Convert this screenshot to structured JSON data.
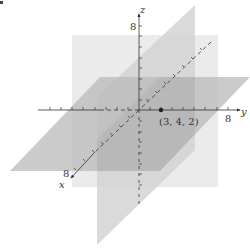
{
  "diagram": {
    "type": "3d-coordinate-system",
    "axes": {
      "x": {
        "label": "x",
        "tick_label": "8"
      },
      "y": {
        "label": "y",
        "tick_label": "8"
      },
      "z": {
        "label": "z",
        "tick_label": "8"
      }
    },
    "point": {
      "label": "(3, 4, 2)",
      "coords": [
        3,
        4,
        2
      ]
    },
    "planes": [
      {
        "name": "plane-x-eq-3",
        "color": "#ebebeb"
      },
      {
        "name": "plane-y-eq-4",
        "color": "#d6d6d6"
      },
      {
        "name": "plane-z-eq-2",
        "color": "#c3c3c3"
      }
    ],
    "colors": {
      "axis": "#333333",
      "background": "#ffffff"
    }
  }
}
